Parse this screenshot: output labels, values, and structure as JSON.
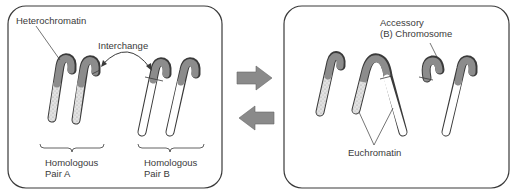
{
  "left_panel": {
    "label_heterochromatin": "Heterochromatin",
    "label_interchange": "Interchange",
    "pair_a": {
      "line1": "Homologous",
      "line2": "Pair A"
    },
    "pair_b": {
      "line1": "Homologous",
      "line2": "Pair B"
    }
  },
  "right_panel": {
    "label_accessory_line1": "Accessory",
    "label_accessory_line2": "(B) Chromosome",
    "label_euchromatin": "Euchromatin"
  },
  "arrows": {
    "forward": "arrow-right",
    "backward": "arrow-left"
  },
  "colors": {
    "heterochromatin": "#8c8c8c",
    "stippled_euchromatin": "#d8d8d8",
    "euchromatin": "#ffffff",
    "arrow": "#8a8a8a",
    "outline": "#3a3a3a"
  }
}
